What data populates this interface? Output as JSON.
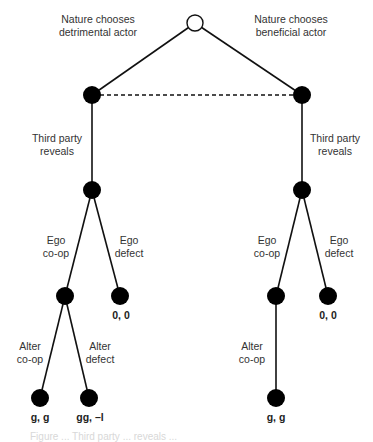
{
  "diagram": {
    "type": "extensive-form game tree",
    "colors": {
      "line": "#111111",
      "node_fill": "#000000",
      "root_fill": "#ffffff",
      "text": "#333333"
    },
    "root": {
      "label_left": "Nature chooses\ndetrimental actor",
      "label_right": "Nature chooses\nbeneficial actor"
    },
    "info_set": "dashed line connecting the two nature outcomes",
    "branches": {
      "left": {
        "reveal_label": "Third party\nreveals",
        "ego_coop_label": "Ego\nco-op",
        "ego_defect_label": "Ego\ndefect",
        "ego_defect_payoff": "0, 0",
        "alter_coop_label": "Alter\nco-op",
        "alter_defect_label": "Alter\ndefect",
        "alter_coop_payoff": "g, g",
        "alter_defect_payoff": "gg, –l"
      },
      "right": {
        "reveal_label": "Third party\nreveals",
        "ego_coop_label": "Ego\nco-op",
        "ego_defect_label": "Ego\ndefect",
        "ego_defect_payoff": "0, 0",
        "alter_coop_label": "Alter\nco-op",
        "alter_coop_payoff": "g, g"
      }
    },
    "caption": "Figure ... Third party ... reveals ..."
  }
}
